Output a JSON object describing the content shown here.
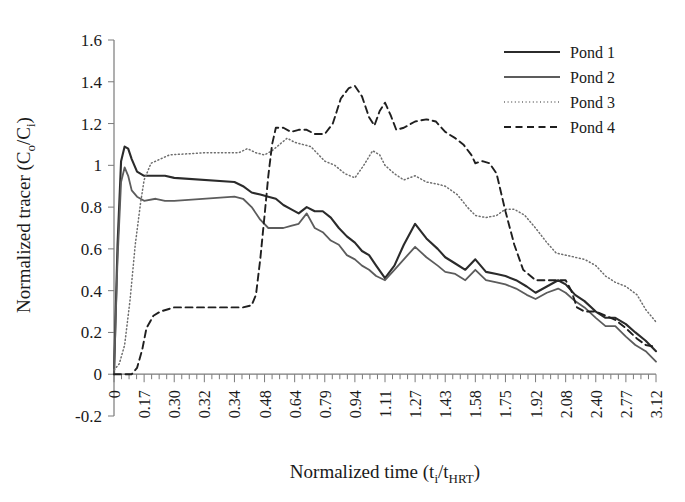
{
  "chart_data": {
    "type": "line",
    "title": "",
    "xlabel": "Normalized time (ti/tHRT)",
    "xlabel_parts": {
      "main": "Normalized time (t",
      "sub1": "i",
      "mid": "/t",
      "sub2": "HRT",
      "end": ")"
    },
    "ylabel": "Normalized tracer (Co/Ci)",
    "ylabel_parts": {
      "main": "Normalized tracer (C",
      "sub1": "o",
      "mid": "/C",
      "sub2": "i",
      "end": ")"
    },
    "ylim": [
      -0.2,
      1.6
    ],
    "yticks": [
      "1.6",
      "1.4",
      "1.2",
      "1",
      "0.8",
      "0.6",
      "0.4",
      "0.2",
      "0",
      "-0.2"
    ],
    "ytick_values": [
      1.6,
      1.4,
      1.2,
      1.0,
      0.8,
      0.6,
      0.4,
      0.2,
      0.0,
      -0.2
    ],
    "categories": [
      "0",
      "0.17",
      "0.30",
      "0.32",
      "0.34",
      "0.48",
      "0.64",
      "0.79",
      "0.94",
      "1.11",
      "1.27",
      "1.43",
      "1.58",
      "1.75",
      "1.92",
      "2.08",
      "2.40",
      "2.77",
      "3.12"
    ],
    "xlim": [
      0,
      3.12
    ],
    "grid": false,
    "legend_position": "top-right",
    "minor_ticks_per_interval": 3,
    "series": [
      {
        "name": "Pond 1",
        "style": "solid",
        "color": "#2b2b2b",
        "width": 2.1,
        "x": [
          0.0,
          0.02,
          0.04,
          0.06,
          0.08,
          0.1,
          0.13,
          0.17,
          0.22,
          0.26,
          0.3,
          0.34,
          0.38,
          0.42,
          0.46,
          0.5,
          0.54,
          0.58,
          0.62,
          0.66,
          0.7,
          0.74,
          0.78,
          0.82,
          0.86,
          0.9,
          0.94,
          0.98,
          1.02,
          1.06,
          1.11,
          1.16,
          1.21,
          1.27,
          1.33,
          1.39,
          1.43,
          1.48,
          1.53,
          1.58,
          1.64,
          1.7,
          1.75,
          1.81,
          1.87,
          1.92,
          1.98,
          2.04,
          2.08,
          2.18,
          2.28,
          2.4,
          2.52,
          2.64,
          2.77,
          2.88,
          3.0,
          3.12
        ],
        "y": [
          0.0,
          0.62,
          1.02,
          1.09,
          1.08,
          1.03,
          0.97,
          0.95,
          0.95,
          0.95,
          0.94,
          0.92,
          0.9,
          0.87,
          0.86,
          0.85,
          0.84,
          0.81,
          0.79,
          0.77,
          0.8,
          0.78,
          0.78,
          0.75,
          0.7,
          0.66,
          0.63,
          0.59,
          0.57,
          0.52,
          0.46,
          0.52,
          0.62,
          0.72,
          0.65,
          0.6,
          0.56,
          0.53,
          0.5,
          0.55,
          0.49,
          0.48,
          0.47,
          0.45,
          0.42,
          0.39,
          0.42,
          0.45,
          0.43,
          0.38,
          0.35,
          0.3,
          0.27,
          0.27,
          0.24,
          0.2,
          0.16,
          0.11
        ]
      },
      {
        "name": "Pond 2",
        "style": "solid",
        "color": "#5c5c5c",
        "width": 1.8,
        "x": [
          0.0,
          0.02,
          0.04,
          0.06,
          0.08,
          0.1,
          0.13,
          0.17,
          0.22,
          0.26,
          0.3,
          0.34,
          0.38,
          0.42,
          0.46,
          0.5,
          0.54,
          0.58,
          0.62,
          0.66,
          0.7,
          0.74,
          0.78,
          0.82,
          0.86,
          0.9,
          0.94,
          0.98,
          1.02,
          1.06,
          1.11,
          1.16,
          1.21,
          1.27,
          1.33,
          1.39,
          1.43,
          1.48,
          1.53,
          1.58,
          1.64,
          1.7,
          1.75,
          1.81,
          1.87,
          1.92,
          1.98,
          2.04,
          2.08,
          2.18,
          2.28,
          2.4,
          2.52,
          2.64,
          2.77,
          2.88,
          3.0,
          3.12
        ],
        "y": [
          0.0,
          0.55,
          0.92,
          0.99,
          0.95,
          0.88,
          0.85,
          0.83,
          0.84,
          0.83,
          0.83,
          0.85,
          0.84,
          0.8,
          0.74,
          0.7,
          0.7,
          0.7,
          0.71,
          0.72,
          0.77,
          0.7,
          0.68,
          0.64,
          0.62,
          0.57,
          0.55,
          0.52,
          0.5,
          0.47,
          0.45,
          0.5,
          0.55,
          0.61,
          0.56,
          0.52,
          0.49,
          0.48,
          0.45,
          0.5,
          0.45,
          0.44,
          0.43,
          0.41,
          0.38,
          0.36,
          0.39,
          0.41,
          0.39,
          0.35,
          0.32,
          0.27,
          0.23,
          0.23,
          0.18,
          0.14,
          0.11,
          0.06
        ]
      },
      {
        "name": "Pond 3",
        "style": "dotted",
        "color": "#6e6e6e",
        "width": 1.5,
        "x": [
          0.0,
          0.03,
          0.06,
          0.09,
          0.12,
          0.15,
          0.17,
          0.2,
          0.24,
          0.28,
          0.32,
          0.36,
          0.4,
          0.44,
          0.48,
          0.52,
          0.56,
          0.6,
          0.64,
          0.68,
          0.72,
          0.76,
          0.79,
          0.84,
          0.89,
          0.94,
          0.99,
          1.04,
          1.08,
          1.11,
          1.16,
          1.21,
          1.27,
          1.33,
          1.39,
          1.43,
          1.49,
          1.54,
          1.58,
          1.64,
          1.7,
          1.75,
          1.8,
          1.86,
          1.92,
          1.98,
          2.03,
          2.08,
          2.18,
          2.28,
          2.4,
          2.52,
          2.64,
          2.77,
          2.9,
          3.0,
          3.12
        ],
        "y": [
          0.02,
          0.05,
          0.14,
          0.35,
          0.62,
          0.82,
          0.93,
          1.01,
          1.03,
          1.05,
          1.06,
          1.06,
          1.08,
          1.06,
          1.05,
          1.07,
          1.1,
          1.13,
          1.11,
          1.1,
          1.09,
          1.05,
          1.02,
          1.0,
          0.96,
          0.94,
          1.0,
          1.07,
          1.05,
          1.0,
          0.96,
          0.93,
          0.95,
          0.92,
          0.91,
          0.9,
          0.86,
          0.8,
          0.76,
          0.75,
          0.76,
          0.79,
          0.79,
          0.76,
          0.7,
          0.63,
          0.58,
          0.57,
          0.56,
          0.55,
          0.52,
          0.47,
          0.44,
          0.42,
          0.38,
          0.31,
          0.25
        ]
      },
      {
        "name": "Pond 4",
        "style": "dashed",
        "color": "#1f1f1f",
        "width": 1.9,
        "x": [
          0.0,
          0.05,
          0.1,
          0.13,
          0.16,
          0.18,
          0.21,
          0.24,
          0.27,
          0.3,
          0.34,
          0.38,
          0.42,
          0.44,
          0.46,
          0.48,
          0.5,
          0.52,
          0.54,
          0.58,
          0.62,
          0.66,
          0.7,
          0.74,
          0.79,
          0.83,
          0.87,
          0.91,
          0.94,
          0.98,
          1.02,
          1.05,
          1.08,
          1.11,
          1.14,
          1.17,
          1.21,
          1.27,
          1.33,
          1.38,
          1.43,
          1.48,
          1.52,
          1.56,
          1.58,
          1.62,
          1.66,
          1.7,
          1.75,
          1.8,
          1.85,
          1.92,
          2.0,
          2.08,
          2.14,
          2.2,
          2.28,
          2.4,
          2.52,
          2.64,
          2.77,
          2.9,
          3.0,
          3.12
        ],
        "y": [
          0.0,
          0.0,
          0.0,
          0.03,
          0.12,
          0.22,
          0.28,
          0.3,
          0.31,
          0.32,
          0.32,
          0.32,
          0.33,
          0.38,
          0.55,
          0.76,
          0.95,
          1.1,
          1.18,
          1.18,
          1.16,
          1.17,
          1.17,
          1.15,
          1.15,
          1.2,
          1.32,
          1.37,
          1.38,
          1.33,
          1.23,
          1.19,
          1.26,
          1.3,
          1.24,
          1.17,
          1.18,
          1.21,
          1.22,
          1.21,
          1.16,
          1.13,
          1.1,
          1.05,
          1.01,
          1.02,
          1.01,
          0.96,
          0.78,
          0.62,
          0.5,
          0.45,
          0.45,
          0.45,
          0.4,
          0.32,
          0.3,
          0.3,
          0.28,
          0.26,
          0.22,
          0.17,
          0.14,
          0.13
        ]
      }
    ]
  },
  "legend": {
    "entries": [
      {
        "label": "Pond 1"
      },
      {
        "label": "Pond 2"
      },
      {
        "label": "Pond 3"
      },
      {
        "label": "Pond 4"
      }
    ]
  }
}
